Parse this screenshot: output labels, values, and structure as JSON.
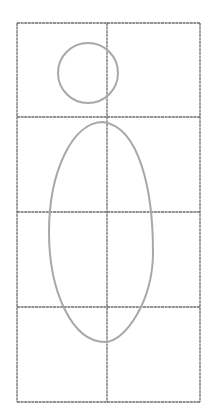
{
  "diagram": {
    "grid": {
      "columns": 2,
      "rows": 4,
      "x_lines": [
        17,
        107,
        200
      ],
      "y_lines": [
        23,
        117,
        212,
        307,
        402
      ],
      "color": "#6e6e6e"
    },
    "shapes": [
      {
        "type": "circle",
        "name": "head-circle",
        "cx": 88,
        "cy": 73,
        "r": 30,
        "color": "#a8a8a8"
      },
      {
        "type": "oval",
        "name": "body-oval",
        "cx": 101,
        "cy": 232,
        "rx": 52,
        "ry": 110,
        "color": "#a8a8a8"
      }
    ]
  }
}
